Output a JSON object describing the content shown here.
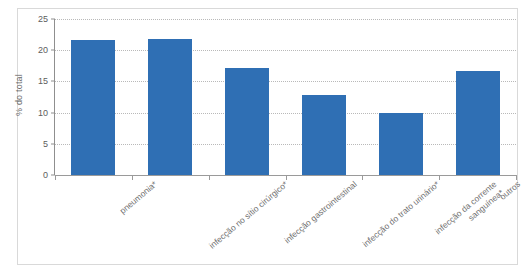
{
  "chart_data": {
    "type": "bar",
    "title": "",
    "subtitle": "",
    "xlabel": "",
    "ylabel": "% do total",
    "ylim": [
      0,
      25
    ],
    "ytick_values": [
      0,
      5,
      10,
      15,
      20,
      25
    ],
    "ytick_labels": [
      "0",
      "5",
      "10",
      "15",
      "20",
      "25"
    ],
    "grid": true,
    "grid_axis": "y",
    "grid_style": "dotted",
    "legend": "none",
    "bar_color": "#2f6fb4",
    "categories": [
      "pneumonia*",
      "infecção no sítio cirúrgico*",
      "infecção gastrointestinal",
      "infecção do trato urinário*",
      "infecção da corrente sanguínea*",
      "outros"
    ],
    "category_lines": [
      [
        "pneumonia*"
      ],
      [
        "infecção no sítio cirúrgico*"
      ],
      [
        "infecção gastrointestinal"
      ],
      [
        "infecção do trato urinário*"
      ],
      [
        "infecção da corrente",
        "sanguínea*"
      ],
      [
        "outros"
      ]
    ],
    "values": [
      21.7,
      21.8,
      17.2,
      12.9,
      10.0,
      16.7
    ]
  },
  "colors": {
    "bar": "#2f6fb4",
    "grid": "#b9b9b9",
    "axis": "#8f8f8f",
    "text": "#6d6d6d",
    "frame": "#d9d9d9",
    "background": "#ffffff"
  }
}
